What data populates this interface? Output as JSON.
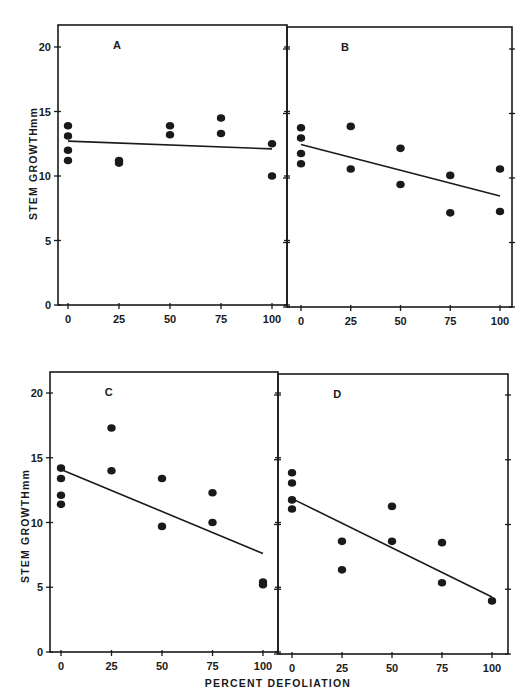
{
  "chart_data": [
    {
      "type": "scatter",
      "panel": "A",
      "xlabel": "PERCENT DEFOLIATION",
      "ylabel": "STEM GROWTH mm",
      "xticks": [
        0,
        25,
        50,
        75,
        100
      ],
      "yticks": [
        0,
        5,
        10,
        15,
        20
      ],
      "xlim": [
        -5,
        105
      ],
      "ylim": [
        0,
        21.5
      ],
      "grid": false,
      "points": [
        [
          0,
          13.9
        ],
        [
          0,
          13.1
        ],
        [
          0,
          12.0
        ],
        [
          0,
          11.2
        ],
        [
          25,
          11.2
        ],
        [
          25,
          11.0
        ],
        [
          50,
          13.9
        ],
        [
          50,
          13.2
        ],
        [
          75,
          14.5
        ],
        [
          75,
          13.3
        ],
        [
          100,
          12.5
        ],
        [
          100,
          10.0
        ]
      ],
      "regression_line": {
        "x": [
          0,
          100
        ],
        "y": [
          12.7,
          12.1
        ]
      }
    },
    {
      "type": "scatter",
      "panel": "B",
      "xlabel": "PERCENT DEFOLIATION",
      "ylabel": "STEM GROWTH mm",
      "xticks": [
        0,
        25,
        50,
        75,
        100
      ],
      "yticks": [
        0,
        5,
        10,
        15,
        20
      ],
      "xlim": [
        -5,
        105
      ],
      "ylim": [
        0,
        21.5
      ],
      "grid": false,
      "points": [
        [
          0,
          13.9
        ],
        [
          0,
          13.1
        ],
        [
          0,
          11.9
        ],
        [
          0,
          11.1
        ],
        [
          25,
          14.0
        ],
        [
          25,
          10.7
        ],
        [
          50,
          12.3
        ],
        [
          50,
          9.5
        ],
        [
          75,
          10.2
        ],
        [
          75,
          7.3
        ],
        [
          100,
          10.7
        ],
        [
          100,
          7.4
        ]
      ],
      "regression_line": {
        "x": [
          0,
          100
        ],
        "y": [
          12.6,
          8.6
        ]
      }
    },
    {
      "type": "scatter",
      "panel": "C",
      "xlabel": "PERCENT DEFOLIATION",
      "ylabel": "STEM GROWTH mm",
      "xticks": [
        0,
        25,
        50,
        75,
        100
      ],
      "yticks": [
        0,
        5,
        10,
        15,
        20
      ],
      "xlim": [
        -5,
        105
      ],
      "ylim": [
        0,
        21.5
      ],
      "grid": false,
      "points": [
        [
          0,
          14.2
        ],
        [
          0,
          13.4
        ],
        [
          0,
          12.1
        ],
        [
          0,
          11.4
        ],
        [
          25,
          17.3
        ],
        [
          25,
          14.0
        ],
        [
          50,
          13.4
        ],
        [
          50,
          9.7
        ],
        [
          75,
          12.3
        ],
        [
          75,
          10.0
        ],
        [
          100,
          5.4
        ],
        [
          100,
          5.2
        ]
      ],
      "regression_line": {
        "x": [
          0,
          100
        ],
        "y": [
          14.1,
          7.6
        ]
      }
    },
    {
      "type": "scatter",
      "panel": "D",
      "xlabel": "PERCENT DEFOLIATION",
      "ylabel": "STEM GROWTH mm",
      "xticks": [
        0,
        25,
        50,
        75,
        100
      ],
      "yticks": [
        0,
        5,
        10,
        15,
        20
      ],
      "xlim": [
        -5,
        105
      ],
      "ylim": [
        0,
        21.5
      ],
      "grid": false,
      "points": [
        [
          0,
          14.0
        ],
        [
          0,
          13.2
        ],
        [
          0,
          11.9
        ],
        [
          0,
          11.2
        ],
        [
          25,
          8.7
        ],
        [
          25,
          6.5
        ],
        [
          50,
          11.4
        ],
        [
          50,
          8.7
        ],
        [
          75,
          8.6
        ],
        [
          75,
          5.5
        ],
        [
          100,
          4.1
        ]
      ],
      "regression_line": {
        "x": [
          0,
          100
        ],
        "y": [
          12.0,
          4.4
        ]
      }
    }
  ],
  "labels": {
    "y_axis_title": "STEM GROWTH",
    "y_axis_unit": "mm",
    "x_axis_title": "PERCENT DEFOLIATION",
    "panel_letters": [
      "A",
      "B",
      "C",
      "D"
    ]
  },
  "style": {
    "ink": "#1a1a1a",
    "background": "#ffffff"
  }
}
